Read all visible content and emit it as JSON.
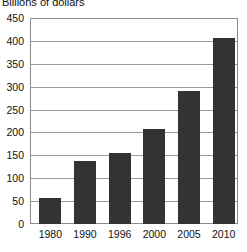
{
  "chart_data": {
    "type": "bar",
    "title": "Billions of dollars",
    "subtitle": "",
    "xlabel": "",
    "ylabel": "",
    "categories": [
      "1980",
      "1990",
      "1996",
      "2000",
      "2005",
      "2010"
    ],
    "values": [
      57,
      138,
      155,
      208,
      290,
      406
    ],
    "ylim": [
      0,
      450
    ],
    "ytick_step": 50,
    "yticks": [
      0,
      50,
      100,
      150,
      200,
      250,
      300,
      350,
      400,
      450
    ],
    "ytick_labels": [
      "0",
      "50",
      "100",
      "150",
      "200",
      "250",
      "300",
      "350",
      "400",
      "450"
    ],
    "grid": true,
    "grid_axis": "y",
    "legend": false,
    "legend_position": "none",
    "bar_color": "#333333",
    "grid_color": "#9a9a9a",
    "frame_color": "#8c8c8c",
    "background_color": "#ffffff"
  }
}
